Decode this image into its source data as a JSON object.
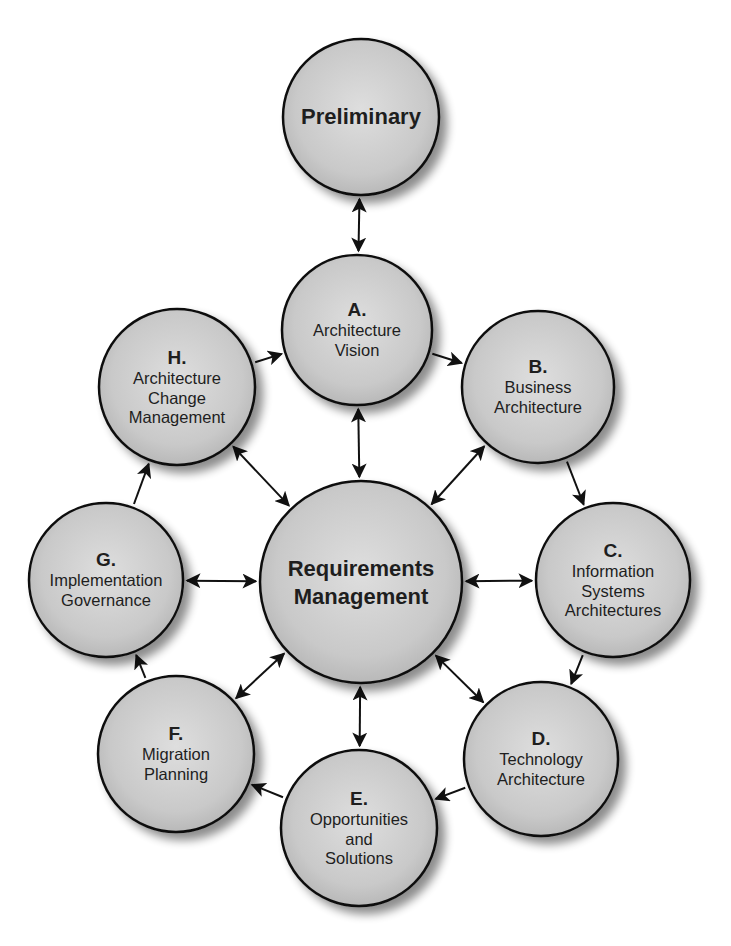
{
  "diagram": {
    "colors": {
      "node_fill_center": "#dcdcdc",
      "node_fill_edge": "#b4b4b4",
      "node_stroke": "#111111",
      "arrow": "#111111",
      "text": "#1e1e1e"
    },
    "nodes": {
      "preliminary": {
        "letter": "",
        "lines": [
          "Preliminary"
        ],
        "cx": 361,
        "cy": 117,
        "r": 78
      },
      "a": {
        "letter": "A.",
        "lines": [
          "Architecture",
          "Vision"
        ],
        "cx": 357,
        "cy": 330,
        "r": 75
      },
      "b": {
        "letter": "B.",
        "lines": [
          "Business",
          "Architecture"
        ],
        "cx": 538,
        "cy": 387,
        "r": 76
      },
      "c": {
        "letter": "C.",
        "lines": [
          "Information",
          "Systems",
          "Architectures"
        ],
        "cx": 613,
        "cy": 580,
        "r": 77
      },
      "d": {
        "letter": "D.",
        "lines": [
          "Technology",
          "Architecture"
        ],
        "cx": 541,
        "cy": 759,
        "r": 77
      },
      "e": {
        "letter": "E.",
        "lines": [
          "Opportunities",
          "and",
          "Solutions"
        ],
        "cx": 359,
        "cy": 828,
        "r": 78
      },
      "f": {
        "letter": "F.",
        "lines": [
          "Migration",
          "Planning"
        ],
        "cx": 176,
        "cy": 754,
        "r": 78
      },
      "g": {
        "letter": "G.",
        "lines": [
          "Implementation",
          "Governance"
        ],
        "cx": 106,
        "cy": 580,
        "r": 77
      },
      "h": {
        "letter": "H.",
        "lines": [
          "Architecture",
          "Change",
          "Management"
        ],
        "cx": 177,
        "cy": 387,
        "r": 78
      },
      "center": {
        "letter": "",
        "lines": [
          "Requirements",
          "Management"
        ],
        "cx": 361,
        "cy": 582,
        "r": 101
      }
    },
    "edges": [
      {
        "from": "preliminary",
        "to": "a",
        "type": "bidirectional"
      },
      {
        "from": "a",
        "to": "b",
        "type": "directed"
      },
      {
        "from": "b",
        "to": "c",
        "type": "directed"
      },
      {
        "from": "c",
        "to": "d",
        "type": "directed"
      },
      {
        "from": "d",
        "to": "e",
        "type": "directed"
      },
      {
        "from": "e",
        "to": "f",
        "type": "directed"
      },
      {
        "from": "f",
        "to": "g",
        "type": "directed"
      },
      {
        "from": "g",
        "to": "h",
        "type": "directed"
      },
      {
        "from": "h",
        "to": "a",
        "type": "directed"
      },
      {
        "from": "center",
        "to": "a",
        "type": "bidirectional"
      },
      {
        "from": "center",
        "to": "b",
        "type": "bidirectional"
      },
      {
        "from": "center",
        "to": "c",
        "type": "bidirectional"
      },
      {
        "from": "center",
        "to": "d",
        "type": "bidirectional"
      },
      {
        "from": "center",
        "to": "e",
        "type": "bidirectional"
      },
      {
        "from": "center",
        "to": "f",
        "type": "bidirectional"
      },
      {
        "from": "center",
        "to": "g",
        "type": "bidirectional"
      },
      {
        "from": "center",
        "to": "h",
        "type": "bidirectional"
      }
    ]
  }
}
